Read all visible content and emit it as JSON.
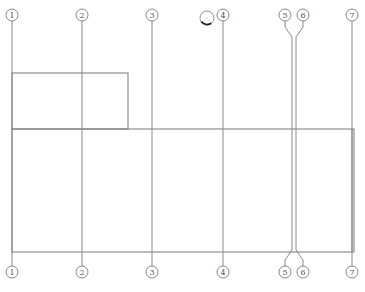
{
  "drawing": {
    "type": "structural-grid-plan",
    "colors": {
      "background": "#ffffff",
      "line": "#8a8a8a",
      "bubble_stroke": "#6a6a6a",
      "label": "#555555",
      "marker_arc": "#222222"
    },
    "bubble_radius": 6,
    "top_bubble_y": 15,
    "bottom_bubble_y": 272,
    "axes": [
      {
        "id": "1",
        "label": "1",
        "x": 12,
        "line_x": 12
      },
      {
        "id": "2",
        "label": "2",
        "x": 82,
        "line_x": 82
      },
      {
        "id": "3",
        "label": "3",
        "x": 152,
        "line_x": 152
      },
      {
        "id": "4",
        "label": "4",
        "x": 223,
        "line_x": 223
      },
      {
        "id": "5",
        "label": "5",
        "x": 285,
        "line_x": 292
      },
      {
        "id": "6",
        "label": "6",
        "x": 303,
        "line_x": 296
      },
      {
        "id": "7",
        "label": "7",
        "x": 352,
        "line_x": 352
      }
    ],
    "rectangles": [
      {
        "name": "small-room",
        "x1": 12,
        "y1": 73,
        "x2": 128,
        "y2": 129
      },
      {
        "name": "main-hall",
        "x1": 12,
        "y1": 129,
        "x2": 354,
        "y2": 252
      }
    ],
    "marker": {
      "cx": 207,
      "cy": 18,
      "r": 7
    }
  }
}
